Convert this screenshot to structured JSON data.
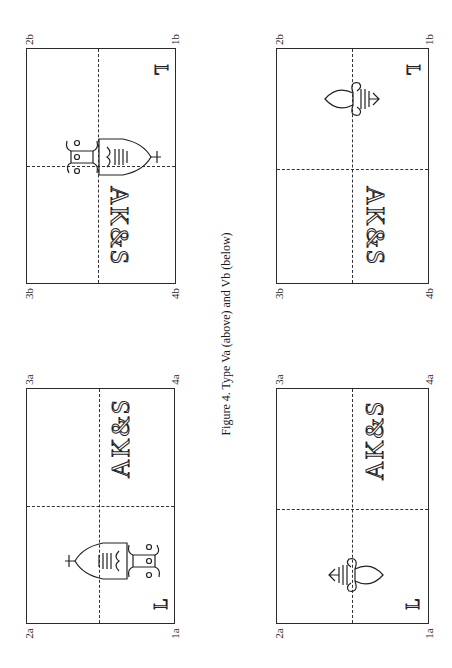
{
  "figure": {
    "caption": "Figure 4. Type Va (above) and Vb (below)"
  },
  "panels": [
    {
      "id": "va-crown",
      "type": "Va",
      "watermark": "crowned-shield-with-fleur-de-lis",
      "initials": "AK&S",
      "mark": "L",
      "corners": {
        "top_left": "2a",
        "top_right": "3a",
        "bottom_left": "1a",
        "bottom_right": "4a"
      }
    },
    {
      "id": "vb-crown",
      "type": "Vb",
      "watermark": "crowned-shield-with-fleur-de-lis",
      "initials": "AK&S",
      "mark": "L",
      "corners": {
        "top_left": "2b",
        "top_right": "3b",
        "bottom_left": "1b",
        "bottom_right": "4b"
      }
    },
    {
      "id": "va-fleur",
      "type": "Va",
      "watermark": "fleur-de-lis",
      "initials": "AK&S",
      "mark": "L",
      "corners": {
        "top_left": "2a",
        "top_right": "3a",
        "bottom_left": "1a",
        "bottom_right": "4a"
      }
    },
    {
      "id": "vb-fleur",
      "type": "Vb",
      "watermark": "fleur-de-lis",
      "initials": "AK&S",
      "mark": "L",
      "corners": {
        "top_left": "2b",
        "top_right": "3b",
        "bottom_left": "1b",
        "bottom_right": "4b"
      }
    }
  ]
}
